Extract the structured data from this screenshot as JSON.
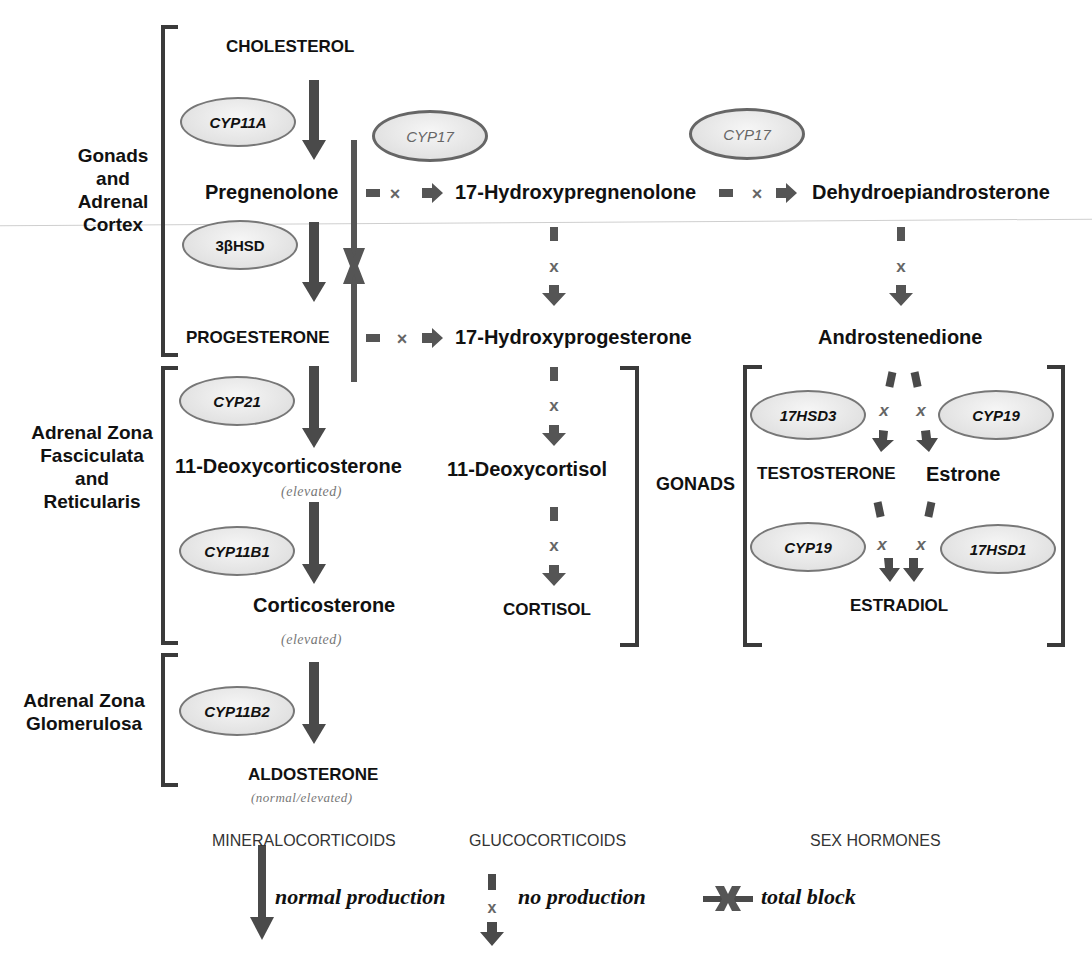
{
  "colors": {
    "arrow": "#4a4a4a",
    "bracket": "#3a3a3a",
    "enzyme_fill": "#e2e2e2",
    "enzyme_border": "#777777",
    "note_text": "#777777"
  },
  "regions": {
    "gonads_adrenal_cortex": [
      "Gonads",
      "and",
      "Adrenal",
      "Cortex"
    ],
    "fasciculata_reticularis": [
      "Adrenal Zona",
      "Fasciculata",
      "and",
      "Reticularis"
    ],
    "glomerulosa": [
      "Adrenal Zona",
      "Glomerulosa"
    ],
    "gonads": "GONADS"
  },
  "compounds": {
    "cholesterol": "CHOLESTEROL",
    "pregnenolone": "Pregnenolone",
    "hydroxypregnenolone": "17-Hydroxypregnenolone",
    "dhea": "Dehydroepiandrosterone",
    "progesterone": "PROGESTERONE",
    "hydroxyprogesterone": "17-Hydroxyprogesterone",
    "androstenedione": "Androstenedione",
    "deoxycorticosterone": "11-Deoxycorticosterone",
    "deoxycorticosterone_note": "(elevated)",
    "deoxycortisol": "11-Deoxycortisol",
    "corticosterone": "Corticosterone",
    "corticosterone_note": "(elevated)",
    "cortisol": "CORTISOL",
    "aldosterone": "ALDOSTERONE",
    "aldosterone_note": "(normal/elevated)",
    "testosterone": "TESTOSTERONE",
    "estrone": "Estrone",
    "estradiol": "ESTRADIOL"
  },
  "enzymes": {
    "cyp11a": "CYP11A",
    "hsd3b": "3βHSD",
    "cyp17_a": "CYP17",
    "cyp17_b": "CYP17",
    "cyp21": "CYP21",
    "cyp11b1": "CYP11B1",
    "cyp11b2": "CYP11B2",
    "hsd17_3": "17HSD3",
    "cyp19_a": "CYP19",
    "cyp19_b": "CYP19",
    "hsd17_1": "17HSD1"
  },
  "classes": {
    "mineralocorticoids": "MINERALOCORTICOIDS",
    "glucocorticoids": "GLUCOCORTICOIDS",
    "sex_hormones": "SEX HORMONES"
  },
  "legend": {
    "normal": "normal production",
    "none": "no production",
    "block": "total block"
  }
}
